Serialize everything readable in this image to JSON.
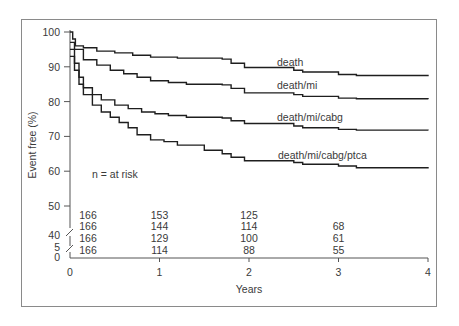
{
  "chart_data": {
    "type": "line",
    "subtype": "kaplan-meier step",
    "title": "",
    "xlabel": "Years",
    "ylabel": "Event free (%)",
    "xlim": [
      0,
      4
    ],
    "ylim": [
      0,
      100
    ],
    "y_axis_break": "between 5 and 40, and between 40 and 50",
    "x_ticks": [
      "0",
      "1",
      "2",
      "3",
      "4"
    ],
    "y_ticks": [
      "0",
      "5",
      "40",
      "50",
      "60",
      "70",
      "80",
      "90",
      "100"
    ],
    "grid": false,
    "annotation": "n = at risk",
    "series": [
      {
        "name": "death",
        "label": "death",
        "points": [
          [
            0,
            100
          ],
          [
            0.03,
            98
          ],
          [
            0.06,
            96
          ],
          [
            0.15,
            95.5
          ],
          [
            0.3,
            94.5
          ],
          [
            0.5,
            94
          ],
          [
            0.7,
            93.3
          ],
          [
            0.9,
            92.8
          ],
          [
            1.2,
            92.5
          ],
          [
            1.7,
            92.2
          ],
          [
            1.8,
            91
          ],
          [
            1.95,
            89.8
          ],
          [
            2.5,
            89
          ],
          [
            2.6,
            88.5
          ],
          [
            3.0,
            87.8
          ],
          [
            3.2,
            87.5
          ],
          [
            4.0,
            87.3
          ]
        ]
      },
      {
        "name": "death/mi",
        "label": "death/mi",
        "points": [
          [
            0,
            97
          ],
          [
            0.05,
            95
          ],
          [
            0.15,
            92
          ],
          [
            0.3,
            90.5
          ],
          [
            0.45,
            89
          ],
          [
            0.6,
            88
          ],
          [
            0.75,
            87
          ],
          [
            0.9,
            86
          ],
          [
            1.1,
            85.5
          ],
          [
            1.3,
            85
          ],
          [
            1.7,
            84.8
          ],
          [
            1.8,
            83.8
          ],
          [
            1.95,
            82.5
          ],
          [
            2.5,
            82
          ],
          [
            2.6,
            81.5
          ],
          [
            3.0,
            81
          ],
          [
            3.2,
            80.8
          ],
          [
            4.0,
            80.7
          ]
        ]
      },
      {
        "name": "death/mi/cabg",
        "label": "death/mi/cabg",
        "points": [
          [
            0,
            95
          ],
          [
            0.05,
            91
          ],
          [
            0.1,
            87
          ],
          [
            0.15,
            84
          ],
          [
            0.25,
            82
          ],
          [
            0.35,
            80.5
          ],
          [
            0.5,
            79
          ],
          [
            0.65,
            78
          ],
          [
            0.8,
            77
          ],
          [
            0.95,
            76.5
          ],
          [
            1.1,
            76
          ],
          [
            1.3,
            75.5
          ],
          [
            1.7,
            75.3
          ],
          [
            1.8,
            74.5
          ],
          [
            1.95,
            73.7
          ],
          [
            2.5,
            73
          ],
          [
            2.6,
            72.5
          ],
          [
            3.0,
            72
          ],
          [
            3.2,
            71.8
          ],
          [
            4.0,
            71.7
          ]
        ]
      },
      {
        "name": "death/mi/cabg/ptca",
        "label": "death/mi/cabg/ptca",
        "points": [
          [
            0,
            93
          ],
          [
            0.05,
            89
          ],
          [
            0.1,
            85
          ],
          [
            0.15,
            82
          ],
          [
            0.25,
            79
          ],
          [
            0.35,
            77
          ],
          [
            0.45,
            75.5
          ],
          [
            0.55,
            74
          ],
          [
            0.65,
            72.5
          ],
          [
            0.75,
            70.5
          ],
          [
            0.9,
            69
          ],
          [
            1.05,
            68.5
          ],
          [
            1.2,
            67.5
          ],
          [
            1.5,
            66
          ],
          [
            1.7,
            65
          ],
          [
            1.8,
            64
          ],
          [
            1.95,
            63
          ],
          [
            2.5,
            62.5
          ],
          [
            2.6,
            62
          ],
          [
            3.0,
            61.5
          ],
          [
            3.2,
            61
          ],
          [
            4.0,
            60.8
          ]
        ]
      }
    ],
    "at_risk": {
      "columns": [
        "0",
        "1",
        "2",
        "3"
      ],
      "rows": [
        {
          "series": "death",
          "values": [
            "166",
            "153",
            "125",
            ""
          ]
        },
        {
          "series": "death/mi",
          "values": [
            "166",
            "144",
            "114",
            "68"
          ]
        },
        {
          "series": "death/mi/cabg",
          "values": [
            "166",
            "129",
            "100",
            "61"
          ]
        },
        {
          "series": "death/mi/cabg/ptca",
          "values": [
            "166",
            "114",
            "88",
            "55"
          ]
        }
      ]
    }
  },
  "colors": {
    "line": "#1e1e1e",
    "axis": "#555555",
    "text": "#3a3a3a",
    "frame": "#8a8a8a"
  }
}
